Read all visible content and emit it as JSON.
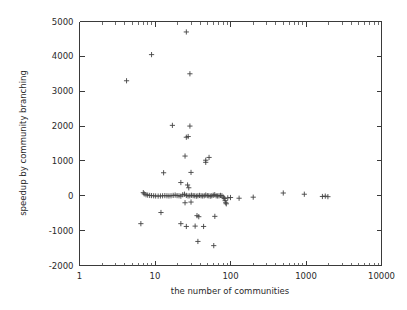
{
  "figure": {
    "background_color": "#ffffff",
    "marker_color": "#434343",
    "axis_color": "#3a3a3a",
    "marker_symbol": "plus"
  },
  "chart_data": {
    "type": "scatter",
    "title": "",
    "xlabel": "the number of communities",
    "ylabel": "speedup by community branching",
    "xscale": "log",
    "yscale": "linear",
    "xlim": [
      1,
      10000
    ],
    "ylim": [
      -2000,
      5000
    ],
    "grid": false,
    "legend": null,
    "xticks": [
      1,
      10,
      100,
      1000,
      10000
    ],
    "xtick_labels": [
      "1",
      "10",
      "100",
      "1000",
      "10000"
    ],
    "yticks": [
      -2000,
      -1000,
      0,
      1000,
      2000,
      3000,
      4000,
      5000
    ],
    "ytick_labels": [
      "-2000",
      "-1000",
      "0",
      "1000",
      "2000",
      "3000",
      "4000",
      "5000"
    ],
    "series": [
      {
        "name": "speedup",
        "marker": "+",
        "points": [
          [
            4.2,
            3300
          ],
          [
            9.0,
            4050
          ],
          [
            26.0,
            4700
          ],
          [
            29.0,
            3500
          ],
          [
            17.0,
            2020
          ],
          [
            29.0,
            2000
          ],
          [
            26.0,
            1680
          ],
          [
            27.5,
            1700
          ],
          [
            25.0,
            1140
          ],
          [
            47.0,
            1020
          ],
          [
            47.0,
            960
          ],
          [
            52.0,
            1100
          ],
          [
            30.0,
            670
          ],
          [
            13.0,
            660
          ],
          [
            22.0,
            380
          ],
          [
            27.0,
            310
          ],
          [
            28.0,
            230
          ],
          [
            7.0,
            90
          ],
          [
            7.2,
            55
          ],
          [
            7.6,
            30
          ],
          [
            8.0,
            20
          ],
          [
            8.5,
            10
          ],
          [
            9.0,
            5
          ],
          [
            9.6,
            0
          ],
          [
            10.2,
            -5
          ],
          [
            11.0,
            -8
          ],
          [
            11.8,
            -5
          ],
          [
            12.6,
            0
          ],
          [
            13.5,
            5
          ],
          [
            14.4,
            0
          ],
          [
            15.3,
            -5
          ],
          [
            16.3,
            0
          ],
          [
            17.4,
            10
          ],
          [
            18.5,
            20
          ],
          [
            19.6,
            5
          ],
          [
            20.8,
            0
          ],
          [
            22.0,
            -10
          ],
          [
            23.3,
            30
          ],
          [
            24.6,
            45
          ],
          [
            26.0,
            10
          ],
          [
            27.4,
            -5
          ],
          [
            28.9,
            0
          ],
          [
            30.4,
            15
          ],
          [
            32.0,
            5
          ],
          [
            33.6,
            0
          ],
          [
            35.3,
            -10
          ],
          [
            37.0,
            0
          ],
          [
            38.9,
            10
          ],
          [
            40.8,
            0
          ],
          [
            42.8,
            -5
          ],
          [
            44.9,
            0
          ],
          [
            47.0,
            20
          ],
          [
            49.3,
            5
          ],
          [
            51.6,
            0
          ],
          [
            54.0,
            -10
          ],
          [
            56.5,
            0
          ],
          [
            59.1,
            15
          ],
          [
            61.8,
            30
          ],
          [
            64.6,
            0
          ],
          [
            67.5,
            -5
          ],
          [
            70.5,
            0
          ],
          [
            73.7,
            10
          ],
          [
            77.0,
            0
          ],
          [
            80.4,
            -40
          ],
          [
            83.0,
            -80
          ],
          [
            85.0,
            -140
          ],
          [
            86.5,
            -200
          ],
          [
            88.0,
            -230
          ],
          [
            92.0,
            -60
          ],
          [
            100.0,
            -50
          ],
          [
            130.0,
            -70
          ],
          [
            200.0,
            -40
          ],
          [
            500.0,
            80
          ],
          [
            950.0,
            45
          ],
          [
            1650.0,
            -20
          ],
          [
            1800.0,
            -10
          ],
          [
            1950.0,
            -25
          ],
          [
            6.5,
            -800
          ],
          [
            12.0,
            -480
          ],
          [
            22.0,
            -800
          ],
          [
            26.0,
            -880
          ],
          [
            30.0,
            -180
          ],
          [
            25.0,
            -200
          ],
          [
            34.0,
            -870
          ],
          [
            36.0,
            -570
          ],
          [
            38.0,
            -600
          ],
          [
            44.0,
            -880
          ],
          [
            62.0,
            -590
          ],
          [
            37.0,
            -1310
          ],
          [
            60.0,
            -1430
          ]
        ]
      }
    ]
  }
}
